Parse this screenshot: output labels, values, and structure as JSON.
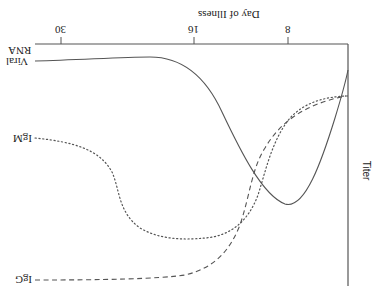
{
  "figure": {
    "orientation": "rotated 180 degrees",
    "x_axis_title": "Day of Illness",
    "y_axis_title": "Titer",
    "x_ticks": [
      "30",
      "16",
      "8"
    ],
    "series": [
      {
        "name": "Viral RNA",
        "label_line1": "Viral",
        "label_line2": "RNA",
        "style": "solid"
      },
      {
        "name": "IgM",
        "label": "IgM",
        "style": "dotted"
      },
      {
        "name": "IgG",
        "label": "IgG",
        "style": "dashed"
      }
    ],
    "colors": {
      "line": "#555555",
      "text": "#222222",
      "background": "#ffffff"
    }
  }
}
